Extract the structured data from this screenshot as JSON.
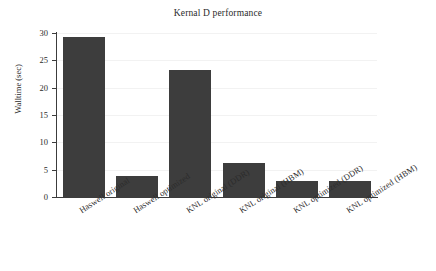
{
  "chart_data": {
    "type": "bar",
    "title": "Kernal D performance",
    "xlabel": "",
    "ylabel": "Walltime (sec)",
    "categories": [
      "Haswell original",
      "Haswell optimized",
      "KNL original (DDR)",
      "KNL original (HBM)",
      "KNL optimized (DDR)",
      "KNL optimized (HBM)"
    ],
    "values": [
      29.3,
      3.8,
      23.2,
      6.3,
      2.9,
      2.9
    ],
    "ylim": [
      0,
      30
    ],
    "yticks": [
      0,
      5,
      10,
      15,
      20,
      25,
      30
    ],
    "ytick_labels": [
      "0",
      "5",
      "10",
      "15",
      "20",
      "25",
      "30"
    ],
    "grid": true,
    "legend": null,
    "bar_color": "#3d3d3d",
    "axis_color": "#3c3c3c",
    "grid_color": "#f2f2f2"
  }
}
